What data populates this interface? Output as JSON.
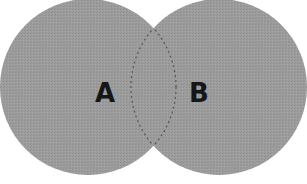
{
  "diagram": {
    "type": "venn",
    "sets": [
      {
        "id": "a",
        "label": "A"
      },
      {
        "id": "b",
        "label": "B"
      }
    ],
    "colors": {
      "fill": "#9a9a9a",
      "outline_dashed": "#555555",
      "label": "#161616",
      "background": "#ffffff"
    }
  }
}
